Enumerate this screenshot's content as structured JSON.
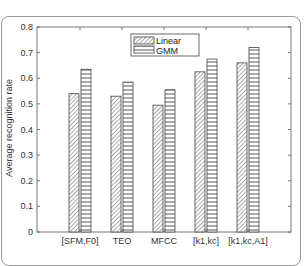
{
  "chart_data": {
    "type": "bar",
    "title": "",
    "xlabel": "",
    "ylabel": "Average recognition rate",
    "ylim": [
      0,
      0.8
    ],
    "yticks": [
      "0",
      "0.1",
      "0.2",
      "0.3",
      "0.4",
      "0.5",
      "0.6",
      "0.7",
      "0.8"
    ],
    "categories": [
      "[SFM,F0]",
      "TEO",
      "MFCC",
      "[k1,kc]",
      "[k1,kc,A1]"
    ],
    "series": [
      {
        "name": "Linear",
        "pattern": "diagonal-hatch",
        "values": [
          0.54,
          0.53,
          0.495,
          0.625,
          0.66
        ]
      },
      {
        "name": "GMM",
        "pattern": "horizontal-lines",
        "values": [
          0.635,
          0.585,
          0.555,
          0.675,
          0.72
        ]
      }
    ],
    "grid": false,
    "legend_position": "upper-center"
  },
  "legend": {
    "items": [
      {
        "label": "Linear"
      },
      {
        "label": "GMM"
      }
    ]
  },
  "colors": {
    "axis": "#555555",
    "bar_stroke": "#444444",
    "hatch": "#555555",
    "frame": "#9a9a9a"
  }
}
